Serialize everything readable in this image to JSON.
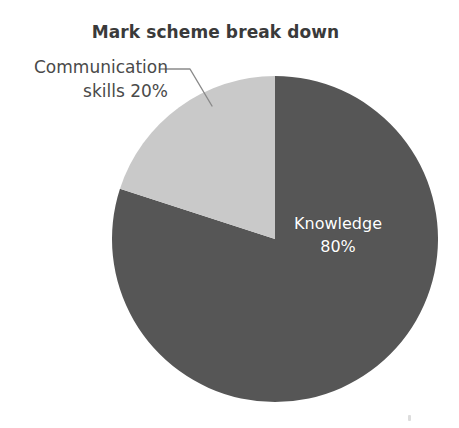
{
  "chart_data": {
    "type": "pie",
    "title": "Mark scheme break down",
    "xlabel": "",
    "ylabel": "",
    "legend_position": "none",
    "grid": false,
    "start_angle_deg": 0,
    "direction": "clockwise",
    "categories": [
      "Knowledge",
      "Communication skills"
    ],
    "values": [
      80,
      20
    ],
    "value_unit": "%",
    "slices": [
      {
        "name": "Knowledge",
        "value": 80,
        "value_label": "80%",
        "label_line1": "Knowledge",
        "label_line2": "80%",
        "color": "#565656",
        "text_color": "#ffffff",
        "label_placement": "inside",
        "sweep_deg": 288
      },
      {
        "name": "Communication skills",
        "value": 20,
        "value_label": "20%",
        "label_line1": "Communication",
        "label_line2": "skills 20%",
        "color": "#c9c9c9",
        "text_color": "#4a4a4a",
        "label_placement": "outside-left-with-leader",
        "sweep_deg": 72
      }
    ],
    "annotations": [
      {
        "name": "communication-leader-line",
        "color": "#8a8a8a",
        "from": "Communication skills label",
        "to": "light slice edge"
      }
    ]
  },
  "colors": {
    "background": "#ffffff",
    "title": "#3a3a3a",
    "knowledge_slice": "#565656",
    "communication_slice": "#c9c9c9",
    "leader_line": "#8a8a8a",
    "inside_label_text": "#ffffff",
    "outside_label_text": "#4a4a4a"
  }
}
